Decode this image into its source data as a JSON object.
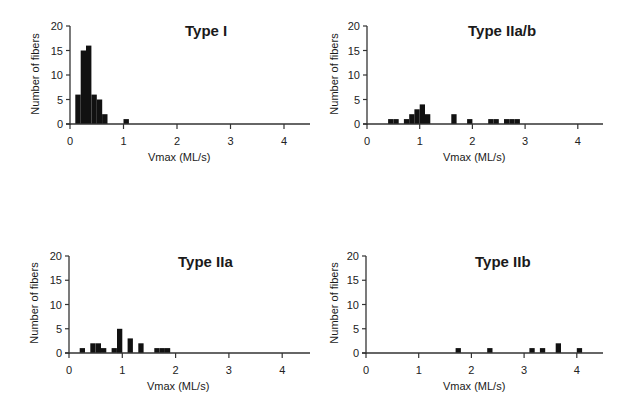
{
  "chart_data": [
    {
      "type": "bar",
      "title": "Type I",
      "xlabel": "Vmax (ML/s)",
      "ylabel": "Number of fibers",
      "xlim": [
        0,
        4.5
      ],
      "ylim": [
        0,
        20
      ],
      "xticks": [
        0,
        1,
        2,
        3,
        4
      ],
      "yticks": [
        0,
        5,
        10,
        15,
        20
      ],
      "grid": false,
      "bin_width": 0.1,
      "bins": [
        {
          "x": 0.1,
          "count": 6
        },
        {
          "x": 0.2,
          "count": 15
        },
        {
          "x": 0.3,
          "count": 16
        },
        {
          "x": 0.4,
          "count": 6
        },
        {
          "x": 0.5,
          "count": 5
        },
        {
          "x": 0.6,
          "count": 2
        },
        {
          "x": 1.0,
          "count": 1
        }
      ]
    },
    {
      "type": "bar",
      "title": "Type IIa/b",
      "xlabel": "Vmax (ML/s)",
      "ylabel": "Number of fibers",
      "xlim": [
        0,
        4.5
      ],
      "ylim": [
        0,
        20
      ],
      "xticks": [
        0,
        1,
        2,
        3,
        4
      ],
      "yticks": [
        0,
        5,
        10,
        15,
        20
      ],
      "grid": false,
      "bin_width": 0.1,
      "bins": [
        {
          "x": 0.4,
          "count": 1
        },
        {
          "x": 0.5,
          "count": 1
        },
        {
          "x": 0.7,
          "count": 1
        },
        {
          "x": 0.8,
          "count": 2
        },
        {
          "x": 0.9,
          "count": 3
        },
        {
          "x": 1.0,
          "count": 4
        },
        {
          "x": 1.1,
          "count": 2
        },
        {
          "x": 1.6,
          "count": 2
        },
        {
          "x": 1.9,
          "count": 1
        },
        {
          "x": 2.3,
          "count": 1
        },
        {
          "x": 2.4,
          "count": 1
        },
        {
          "x": 2.6,
          "count": 1
        },
        {
          "x": 2.7,
          "count": 1
        },
        {
          "x": 2.8,
          "count": 1
        }
      ]
    },
    {
      "type": "bar",
      "title": "Type IIa",
      "xlabel": "Vmax (ML/s)",
      "ylabel": "Number of fibers",
      "xlim": [
        0,
        4.5
      ],
      "ylim": [
        0,
        20
      ],
      "xticks": [
        0,
        1,
        2,
        3,
        4
      ],
      "yticks": [
        0,
        5,
        10,
        15,
        20
      ],
      "grid": false,
      "bin_width": 0.1,
      "bins": [
        {
          "x": 0.2,
          "count": 1
        },
        {
          "x": 0.4,
          "count": 2
        },
        {
          "x": 0.5,
          "count": 2
        },
        {
          "x": 0.6,
          "count": 1
        },
        {
          "x": 0.8,
          "count": 1
        },
        {
          "x": 0.9,
          "count": 5
        },
        {
          "x": 1.1,
          "count": 3
        },
        {
          "x": 1.3,
          "count": 2
        },
        {
          "x": 1.6,
          "count": 1
        },
        {
          "x": 1.7,
          "count": 1
        },
        {
          "x": 1.8,
          "count": 1
        }
      ]
    },
    {
      "type": "bar",
      "title": "Type IIb",
      "xlabel": "Vmax (ML/s)",
      "ylabel": "Number of fibers",
      "xlim": [
        0,
        4.5
      ],
      "ylim": [
        0,
        20
      ],
      "xticks": [
        0,
        1,
        2,
        3,
        4
      ],
      "yticks": [
        0,
        5,
        10,
        15,
        20
      ],
      "grid": false,
      "bin_width": 0.1,
      "bins": [
        {
          "x": 1.7,
          "count": 1
        },
        {
          "x": 2.3,
          "count": 1
        },
        {
          "x": 3.1,
          "count": 1
        },
        {
          "x": 3.3,
          "count": 1
        },
        {
          "x": 3.6,
          "count": 2
        },
        {
          "x": 4.0,
          "count": 1
        }
      ]
    }
  ],
  "panels": [
    {
      "title": "Type I",
      "xlabel": "Vmax (ML/s)",
      "ylabel": "Number of fibers"
    },
    {
      "title": "Type IIa/b",
      "xlabel": "Vmax (ML/s)",
      "ylabel": "Number of fibers"
    },
    {
      "title": "Type IIa",
      "xlabel": "Vmax (ML/s)",
      "ylabel": "Number of fibers"
    },
    {
      "title": "Type IIb",
      "xlabel": "Vmax (ML/s)",
      "ylabel": "Number of fibers"
    }
  ],
  "colors": {
    "bar": "#111111",
    "axis": "#333333"
  }
}
